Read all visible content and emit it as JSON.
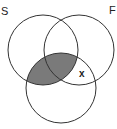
{
  "diagram": {
    "type": "venn",
    "labels": {
      "left": "S",
      "right": "F",
      "mark": "x"
    },
    "circles": [
      {
        "name": "S",
        "cx": 43,
        "cy": 50,
        "r": 35
      },
      {
        "name": "F",
        "cx": 79,
        "cy": 50,
        "r": 35
      },
      {
        "name": "bottom",
        "cx": 61,
        "cy": 88,
        "r": 35
      }
    ],
    "shaded_region": "S ∩ bottom",
    "shade_color": "#7a7a7a",
    "stroke_color": "#333333"
  }
}
